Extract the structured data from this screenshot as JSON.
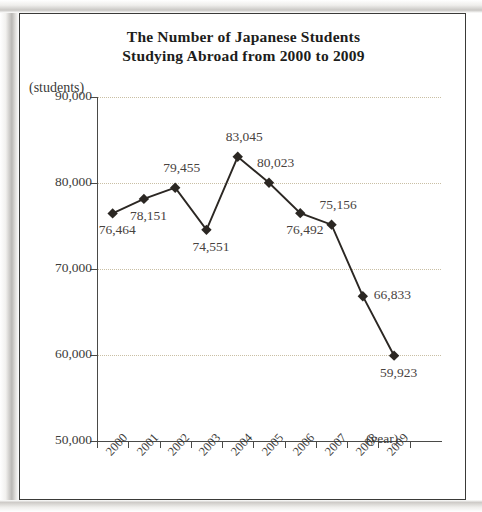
{
  "title": {
    "line1": "The Number of Japanese Students",
    "line2": "Studying Abroad from 2000 to 2009"
  },
  "axis": {
    "unit_label": "(students)",
    "x_title": "(year)",
    "y_ticks": [
      "90,000",
      "80,000",
      "70,000",
      "60,000",
      "50,000"
    ]
  },
  "chart_data": {
    "type": "line",
    "title": "The Number of Japanese Students Studying Abroad from 2000 to 2009",
    "xlabel": "(year)",
    "ylabel": "(students)",
    "ylim": [
      50000,
      90000
    ],
    "ytick_values": [
      90000,
      80000,
      70000,
      60000,
      50000
    ],
    "grid": true,
    "legend": "none",
    "categories": [
      "2000",
      "2001",
      "2002",
      "2003",
      "2004",
      "2005",
      "2006",
      "2007",
      "2008",
      "2009"
    ],
    "values": [
      76464,
      78151,
      79455,
      74551,
      83045,
      80023,
      76492,
      75156,
      66833,
      59923
    ],
    "point_labels": [
      "76,464",
      "78,151",
      "79,455",
      "74,551",
      "83,045",
      "80,023",
      "76,492",
      "75,156",
      "66,833",
      "59,923"
    ],
    "label_positions": [
      "below",
      "below",
      "above",
      "below",
      "above",
      "above",
      "below",
      "above",
      "right",
      "below"
    ],
    "marker": "diamond",
    "line_color": "#2b2723",
    "marker_color": "#2b2723",
    "grid_color": "#c9bfa4"
  }
}
